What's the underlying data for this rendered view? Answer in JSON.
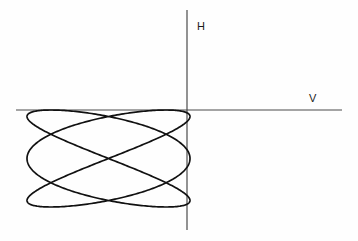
{
  "canvas": {
    "width": 358,
    "height": 241,
    "background_color": "#fefefe"
  },
  "axes": {
    "vertical": {
      "label": "H",
      "label_name": "horizontal-deflection-axis-label",
      "x": 187,
      "y_start": 10,
      "y_end": 230,
      "color": "#4a4a4a",
      "stroke_width": 1.2
    },
    "horizontal": {
      "label": "V",
      "label_name": "vertical-deflection-axis-label",
      "y": 110,
      "x_start": 16,
      "x_end": 342,
      "color": "#4a4a4a",
      "stroke_width": 1.2
    }
  },
  "chart_data": {
    "type": "line",
    "title": "",
    "subtitle": "",
    "xlabel": "V",
    "ylabel": "H",
    "grid": false,
    "legend": null,
    "curve_name": "lissajous-figure",
    "parametric": {
      "x_expression": "cx + a * sin(3 * t + phase)",
      "y_expression": "cy + b * sin(2 * t)",
      "freq_x": 3,
      "freq_y": 2,
      "phase_deg": 90,
      "t_range_deg": [
        0,
        360
      ],
      "samples": 720
    },
    "bounds": {
      "x_min": 27,
      "x_max": 190,
      "y_min": 110,
      "y_max": 207
    },
    "center": {
      "cx": 108.5,
      "cy": 158.5
    },
    "amplitude": {
      "a": 81.5,
      "b": 48.5
    },
    "top_lobes": 3,
    "bottom_lobes": 3,
    "side_lobes": 2,
    "stroke_color": "#111111",
    "stroke_width": 1.7,
    "xlim": [
      16,
      342
    ],
    "ylim": [
      10,
      230
    ]
  }
}
